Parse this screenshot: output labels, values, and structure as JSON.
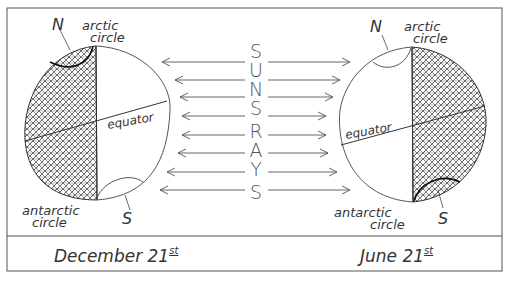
{
  "diagram": {
    "title_vertical": "SUNS RAYS",
    "ray_letters": [
      "S",
      "U",
      "N",
      "S",
      "R",
      "A",
      "Y",
      "S"
    ],
    "left_globe": {
      "season_label": "December 21",
      "season_suffix": "st",
      "north_label": "N",
      "south_label": "S",
      "arctic_label_line1": "arctic",
      "arctic_label_line2": "circle",
      "antarctic_label_line1": "antarctic",
      "antarctic_label_line2": "circle",
      "equator_label": "equator",
      "shaded_side": "left"
    },
    "right_globe": {
      "season_label": "June 21",
      "season_suffix": "st",
      "north_label": "N",
      "south_label": "S",
      "arctic_label_line1": "arctic",
      "arctic_label_line2": "circle",
      "antarctic_label_line1": "antarctic",
      "antarctic_label_line2": "circle",
      "equator_label": "equator",
      "shaded_side": "right"
    },
    "colors": {
      "ink": "#333333",
      "frame": "#555555",
      "background": "#ffffff"
    }
  }
}
